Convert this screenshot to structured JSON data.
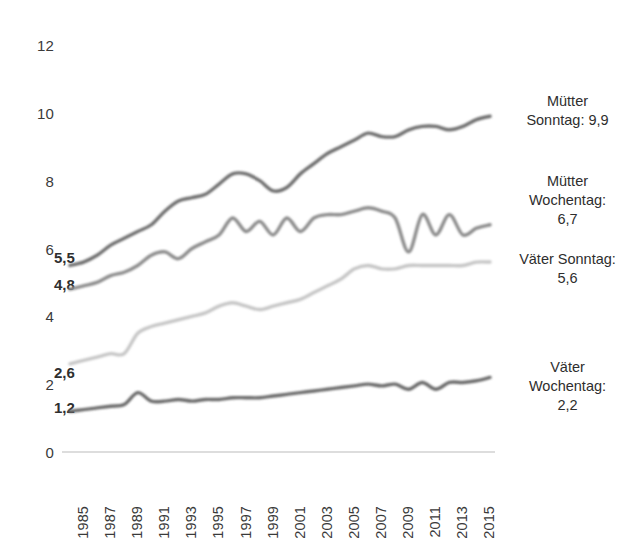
{
  "chart_data": {
    "type": "line",
    "title": "",
    "subtitle": "",
    "xlabel": "",
    "ylabel": "",
    "xlim": [
      1985,
      2016
    ],
    "ylim": [
      0,
      12
    ],
    "grid": false,
    "legend_position": "right-inline-labels",
    "x": [
      1985,
      1986,
      1987,
      1988,
      1989,
      1990,
      1991,
      1992,
      1993,
      1994,
      1995,
      1996,
      1997,
      1998,
      1999,
      2000,
      2001,
      2002,
      2003,
      2004,
      2005,
      2006,
      2007,
      2008,
      2009,
      2010,
      2011,
      2012,
      2013,
      2014,
      2015,
      2016
    ],
    "x_tick_labels": [
      "1985",
      "1987",
      "1989",
      "1991",
      "1993",
      "1995",
      "1997",
      "1999",
      "2001",
      "2003",
      "2005",
      "2007",
      "2009",
      "2011",
      "2013",
      "2015"
    ],
    "y_tick_labels": [
      "0",
      "2",
      "4",
      "6",
      "8",
      "10",
      "12"
    ],
    "y_ticks": [
      0,
      2,
      4,
      6,
      8,
      10,
      12
    ],
    "series": [
      {
        "name": "Mütter Sonntag",
        "color": "#6e6e6e",
        "start_value": 5.5,
        "end_value": 9.9,
        "values": [
          5.5,
          5.6,
          5.8,
          6.1,
          6.3,
          6.5,
          6.7,
          7.1,
          7.4,
          7.5,
          7.6,
          7.9,
          8.2,
          8.2,
          8.0,
          7.7,
          7.8,
          8.2,
          8.5,
          8.8,
          9.0,
          9.2,
          9.4,
          9.3,
          9.3,
          9.5,
          9.6,
          9.6,
          9.5,
          9.6,
          9.8,
          9.9
        ]
      },
      {
        "name": "Mütter Wochentag",
        "color": "#8c8c8c",
        "start_value": 4.8,
        "end_value": 6.7,
        "values": [
          4.8,
          4.9,
          5.0,
          5.2,
          5.3,
          5.5,
          5.8,
          5.9,
          5.7,
          6.0,
          6.2,
          6.4,
          6.9,
          6.5,
          6.8,
          6.4,
          6.9,
          6.5,
          6.9,
          7.0,
          7.0,
          7.1,
          7.2,
          7.1,
          6.9,
          5.9,
          7.0,
          6.4,
          7.0,
          6.4,
          6.6,
          6.7
        ]
      },
      {
        "name": "Väter Sonntag",
        "color": "#c6c6c6",
        "start_value": 2.6,
        "end_value": 5.6,
        "values": [
          2.6,
          2.7,
          2.8,
          2.9,
          2.9,
          3.5,
          3.7,
          3.8,
          3.9,
          4.0,
          4.1,
          4.3,
          4.4,
          4.3,
          4.2,
          4.3,
          4.4,
          4.5,
          4.7,
          4.9,
          5.1,
          5.4,
          5.5,
          5.4,
          5.4,
          5.5,
          5.5,
          5.5,
          5.5,
          5.5,
          5.6,
          5.6
        ]
      },
      {
        "name": "Väter Wochentag",
        "color": "#6b6b6b",
        "start_value": 1.2,
        "end_value": 2.2,
        "values": [
          1.2,
          1.25,
          1.3,
          1.35,
          1.4,
          1.75,
          1.5,
          1.5,
          1.55,
          1.5,
          1.55,
          1.55,
          1.6,
          1.6,
          1.6,
          1.65,
          1.7,
          1.75,
          1.8,
          1.85,
          1.9,
          1.95,
          2.0,
          1.95,
          2.0,
          1.85,
          2.05,
          1.85,
          2.05,
          2.05,
          2.1,
          2.2
        ]
      }
    ],
    "start_annotations": [
      {
        "label": "5,5",
        "value": 5.5
      },
      {
        "label": "4,8",
        "value": 4.8
      },
      {
        "label": "2,6",
        "value": 2.6
      },
      {
        "label": "1,2",
        "value": 1.2
      }
    ],
    "series_labels": [
      {
        "text": "Mütter\nSonntag: 9,9"
      },
      {
        "text": "Mütter\nWochentag:\n6,7"
      },
      {
        "text": "Väter Sonntag:\n5,6"
      },
      {
        "text": "Väter\nWochentag:\n2,2"
      }
    ]
  }
}
